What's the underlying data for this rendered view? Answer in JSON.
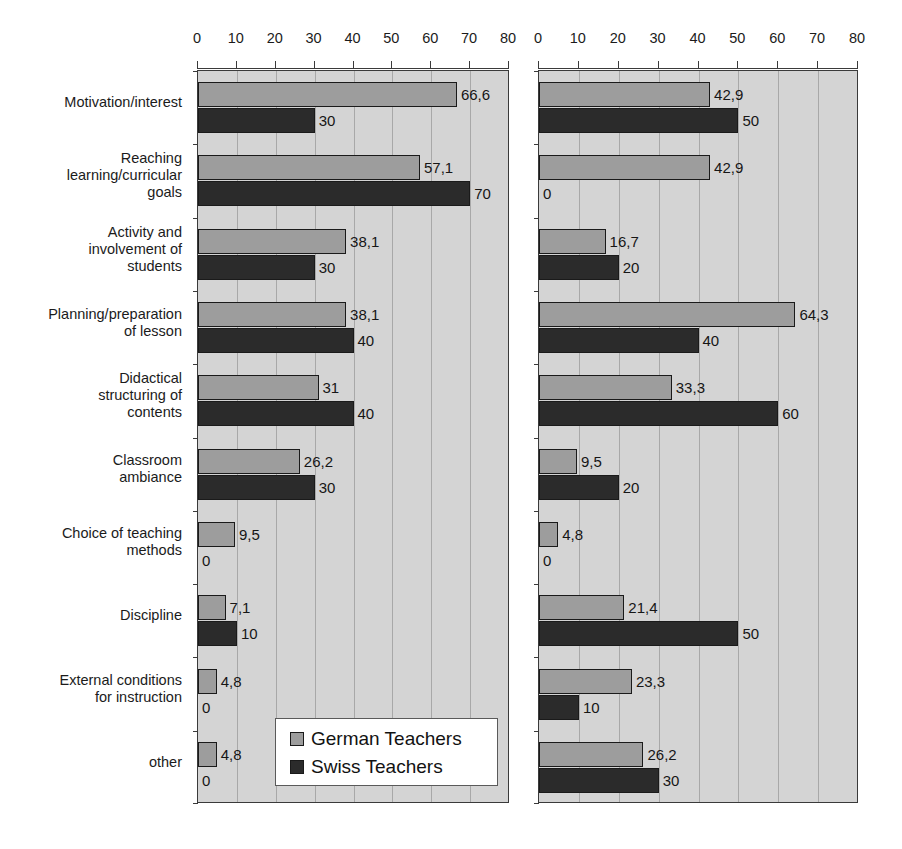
{
  "chart_data": {
    "type": "bar",
    "orientation": "horizontal",
    "title": "",
    "subtitle": "",
    "xlabel": "",
    "ylabel": "",
    "xlim": [
      0,
      80
    ],
    "xticks": [
      0,
      10,
      20,
      30,
      40,
      50,
      60,
      70,
      80
    ],
    "grid": true,
    "legend": {
      "position": "bottom-left-panel",
      "entries": [
        {
          "name": "German Teachers",
          "color": "#9d9d9d"
        },
        {
          "name": "Swiss Teachers",
          "color": "#2b2b2b"
        }
      ]
    },
    "categories": [
      "Motivation/interest",
      "Reaching\nlearning/curricular\ngoals",
      "Activity and\ninvolvement of\nstudents",
      "Planning/preparation\nof lesson",
      "Didactical\nstructuring of\ncontents",
      "Classroom\nambiance",
      "Choice of teaching\nmethods",
      "Discipline",
      "External conditions\nfor instruction",
      "other"
    ],
    "panels": [
      {
        "id": "left",
        "series": [
          {
            "name": "German Teachers",
            "color": "#9d9d9d",
            "values": [
              66.6,
              57.1,
              38.1,
              38.1,
              31,
              26.2,
              9.5,
              7.1,
              4.8,
              4.8
            ],
            "labels": [
              "66,6",
              "57,1",
              "38,1",
              "38,1",
              "31",
              "26,2",
              "9,5",
              "7,1",
              "4,8",
              "4,8"
            ]
          },
          {
            "name": "Swiss Teachers",
            "color": "#2b2b2b",
            "values": [
              30,
              70,
              30,
              40,
              40,
              30,
              0,
              10,
              0,
              0
            ],
            "labels": [
              "30",
              "70",
              "30",
              "40",
              "40",
              "30",
              "0",
              "10",
              "0",
              "0"
            ]
          }
        ]
      },
      {
        "id": "right",
        "series": [
          {
            "name": "German Teachers",
            "color": "#9d9d9d",
            "values": [
              42.9,
              42.9,
              16.7,
              64.3,
              33.3,
              9.5,
              4.8,
              21.4,
              23.3,
              26.2
            ],
            "labels": [
              "42,9",
              "42,9",
              "16,7",
              "64,3",
              "33,3",
              "9,5",
              "4,8",
              "21,4",
              "23,3",
              "26,2"
            ]
          },
          {
            "name": "Swiss Teachers",
            "color": "#2b2b2b",
            "values": [
              50,
              0,
              20,
              40,
              60,
              20,
              0,
              50,
              10,
              30
            ],
            "labels": [
              "50",
              "0",
              "20",
              "40",
              "60",
              "20",
              "0",
              "50",
              "10",
              "30"
            ]
          }
        ]
      }
    ]
  }
}
